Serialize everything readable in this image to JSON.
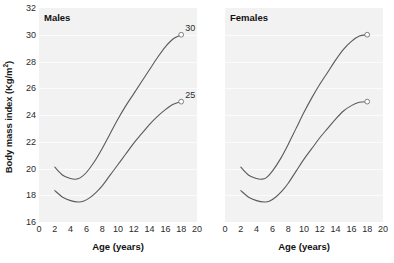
{
  "chart_data": {
    "type": "line",
    "title": "",
    "xlabel": "Age (years)",
    "ylabel": "Body mass index (Kg/m²)",
    "ylabel_base": "Body mass index (Kg/m",
    "ylabel_sup": "2",
    "ylabel_close": ")",
    "xlim": [
      0,
      20
    ],
    "ylim": [
      16,
      32
    ],
    "grid": "horizontal-faint",
    "legend": "none",
    "xticks": [
      0,
      2,
      4,
      6,
      8,
      10,
      12,
      14,
      16,
      18,
      20
    ],
    "yticks": [
      16,
      18,
      20,
      22,
      24,
      26,
      28,
      30,
      32
    ],
    "panels": [
      {
        "name": "males",
        "title": "Males",
        "series": [
          {
            "name": "upper-centile",
            "end_label": "30",
            "end_marker": true,
            "x": [
              2.0,
              3.0,
              4.0,
              4.6,
              5.2,
              6.0,
              7.0,
              8.0,
              9.0,
              10.0,
              11.0,
              12.0,
              13.0,
              14.0,
              15.0,
              16.0,
              17.0,
              18.0
            ],
            "y": [
              20.1,
              19.5,
              19.25,
              19.2,
              19.3,
              19.7,
              20.5,
              21.5,
              22.6,
              23.7,
              24.7,
              25.6,
              26.5,
              27.4,
              28.3,
              29.1,
              29.7,
              30.0
            ]
          },
          {
            "name": "lower-centile",
            "end_label": "25",
            "end_marker": true,
            "x": [
              2.0,
              3.0,
              4.0,
              5.0,
              5.6,
              6.4,
              7.2,
              8.0,
              9.0,
              10.0,
              11.0,
              12.0,
              13.0,
              14.0,
              15.0,
              16.0,
              17.0,
              18.0
            ],
            "y": [
              18.35,
              17.85,
              17.6,
              17.5,
              17.55,
              17.8,
              18.2,
              18.7,
              19.5,
              20.3,
              21.1,
              21.9,
              22.6,
              23.3,
              23.9,
              24.4,
              24.8,
              25.0
            ]
          }
        ]
      },
      {
        "name": "females",
        "title": "Females",
        "series": [
          {
            "name": "upper-centile",
            "end_label": "",
            "end_marker": true,
            "x": [
              2.0,
              3.0,
              4.0,
              4.6,
              5.2,
              6.0,
              7.0,
              8.0,
              9.0,
              10.0,
              11.0,
              12.0,
              13.0,
              14.0,
              15.0,
              16.0,
              17.0,
              18.0
            ],
            "y": [
              20.1,
              19.5,
              19.25,
              19.2,
              19.3,
              19.8,
              20.7,
              21.8,
              23.0,
              24.2,
              25.3,
              26.3,
              27.2,
              28.1,
              28.9,
              29.5,
              29.9,
              30.0
            ]
          },
          {
            "name": "lower-centile",
            "end_label": "",
            "end_marker": true,
            "x": [
              2.0,
              3.0,
              4.0,
              5.0,
              5.6,
              6.4,
              7.2,
              8.0,
              9.0,
              10.0,
              11.0,
              12.0,
              13.0,
              14.0,
              15.0,
              16.0,
              17.0,
              18.0
            ],
            "y": [
              18.35,
              17.85,
              17.6,
              17.5,
              17.55,
              17.85,
              18.3,
              18.9,
              19.8,
              20.7,
              21.5,
              22.3,
              23.0,
              23.7,
              24.3,
              24.7,
              24.95,
              25.0
            ]
          }
        ]
      }
    ],
    "colors": {
      "line": "#5a5a5a",
      "plot_background": "#f2f2f2",
      "gridline": "#fbfbfb",
      "marker_fill": "#ffffff",
      "marker_stroke": "#808080",
      "text": "#1a1a1a",
      "figure_background": "#ffffff"
    }
  }
}
